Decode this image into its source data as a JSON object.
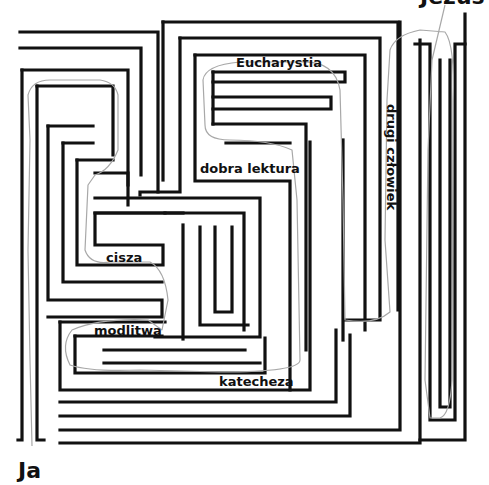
{
  "diagram": {
    "type": "maze",
    "start_label": "Ja",
    "end_label": "Jezus",
    "labels": {
      "eucharystia": "Eucharystia",
      "drugi_czlowiek": "drugi człowiek",
      "dobra_lektura": "dobra lektura",
      "cisza": "cisza",
      "modlitwa": "modlitwa",
      "katecheza": "katecheza"
    },
    "path_waypoints_order": [
      "Ja",
      "modlitwa",
      "katecheza",
      "cisza",
      "dobra lektura",
      "Eucharystia",
      "drugi człowiek",
      "Jezus"
    ],
    "colors": {
      "wall": "#111111",
      "solution_path": "#a8a8a8",
      "background": "#ffffff"
    }
  }
}
